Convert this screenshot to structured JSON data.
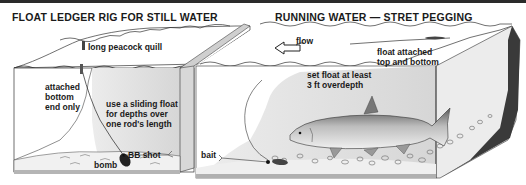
{
  "panels": [
    {
      "title": "FLOAT LEDGER RIG FOR STILL WATER",
      "labels": {
        "float": "long peacock quill",
        "attached_1": "attached",
        "attached_2": "bottom",
        "attached_3": "end only",
        "sliding_1": "use a sliding float",
        "sliding_2": "for depths over",
        "sliding_3": "one rod's length",
        "shot": "BB shot",
        "weight": "bomb"
      }
    },
    {
      "title": "RUNNING WATER — STRET PEGGING",
      "labels": {
        "flow": "flow",
        "float_1": "float attached",
        "float_2": "top and bottom",
        "set_1": "set float at least",
        "set_2": "3 ft overdepth",
        "bait": "bait"
      }
    }
  ],
  "colors": {
    "water": "#e6e6e6",
    "water_dark": "#cfcfcf",
    "bed": "#f2f2f2",
    "bank_dark": "#3a3a3a",
    "line": "#2a2a2a"
  }
}
